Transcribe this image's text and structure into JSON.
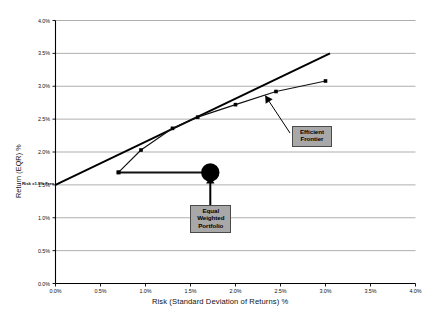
{
  "chart_data": {
    "type": "line",
    "title": "",
    "xlabel": "Risk (Standard Deviation of Returns) %",
    "ylabel": "Return (EQR) %",
    "xlim": [
      0.0,
      4.0
    ],
    "ylim": [
      0.0,
      4.0
    ],
    "xticks": [
      "0.0%",
      "0.5%",
      "1.0%",
      "1.5%",
      "2.0%",
      "2.5%",
      "3.0%",
      "3.5%",
      "4.0%"
    ],
    "xtick_values": [
      0.0,
      0.5,
      1.0,
      1.5,
      2.0,
      2.5,
      3.0,
      3.5,
      4.0
    ],
    "yticks": [
      "0.0%",
      "0.5%",
      "1.0%",
      "1.5%",
      "2.0%",
      "2.5%",
      "3.0%",
      "3.5%",
      "4.0%"
    ],
    "ytick_values": [
      0.0,
      0.5,
      1.0,
      1.5,
      2.0,
      2.5,
      3.0,
      3.5,
      4.0
    ],
    "grid": "horizontal",
    "legend": "none",
    "series": [
      {
        "name": "Efficient Frontier",
        "type": "line",
        "marker": "square",
        "points": [
          {
            "x": 0.7,
            "y": 1.69
          },
          {
            "x": 0.95,
            "y": 2.03
          },
          {
            "x": 1.3,
            "y": 2.36
          },
          {
            "x": 1.58,
            "y": 2.53
          },
          {
            "x": 2.0,
            "y": 2.72
          },
          {
            "x": 2.45,
            "y": 2.92
          },
          {
            "x": 3.0,
            "y": 3.08
          }
        ]
      },
      {
        "name": "Capital Market Line",
        "type": "tangent-line",
        "marker": "none",
        "points": [
          {
            "x": 0.0,
            "y": 1.5
          },
          {
            "x": 3.05,
            "y": 3.5
          }
        ]
      },
      {
        "name": "Equal Weighted Portfolio Connector",
        "type": "line",
        "marker": "none",
        "points": [
          {
            "x": 0.7,
            "y": 1.69
          },
          {
            "x": 1.72,
            "y": 1.69
          }
        ]
      }
    ],
    "markers": [
      {
        "name": "Equal Weighted Portfolio",
        "shape": "large-filled-circle",
        "x": 1.72,
        "y": 1.69
      }
    ],
    "annotations": [
      {
        "name": "risk-free-rate",
        "line1": "Risk =1.5%",
        "line2": "Free",
        "x": 0.0,
        "y": 1.5
      },
      {
        "name": "efficient-frontier-callout",
        "line1": "Efficient",
        "line2": "Frontier",
        "target_x": 2.45,
        "target_y": 2.92
      },
      {
        "name": "equal-weighted-portfolio-callout",
        "line1": "Equal",
        "line2": "Weighted",
        "line3": "Portfolio",
        "target_x": 1.72,
        "target_y": 1.69
      }
    ],
    "colors": {
      "axis": "#000000",
      "grid": "#9a9a9a",
      "frontier": "#111111",
      "tangent": "#000000",
      "marker": "#000000",
      "callout_fill": "#a8a8a8",
      "callout_border": "#4a4a4a",
      "background": "#ffffff"
    }
  }
}
